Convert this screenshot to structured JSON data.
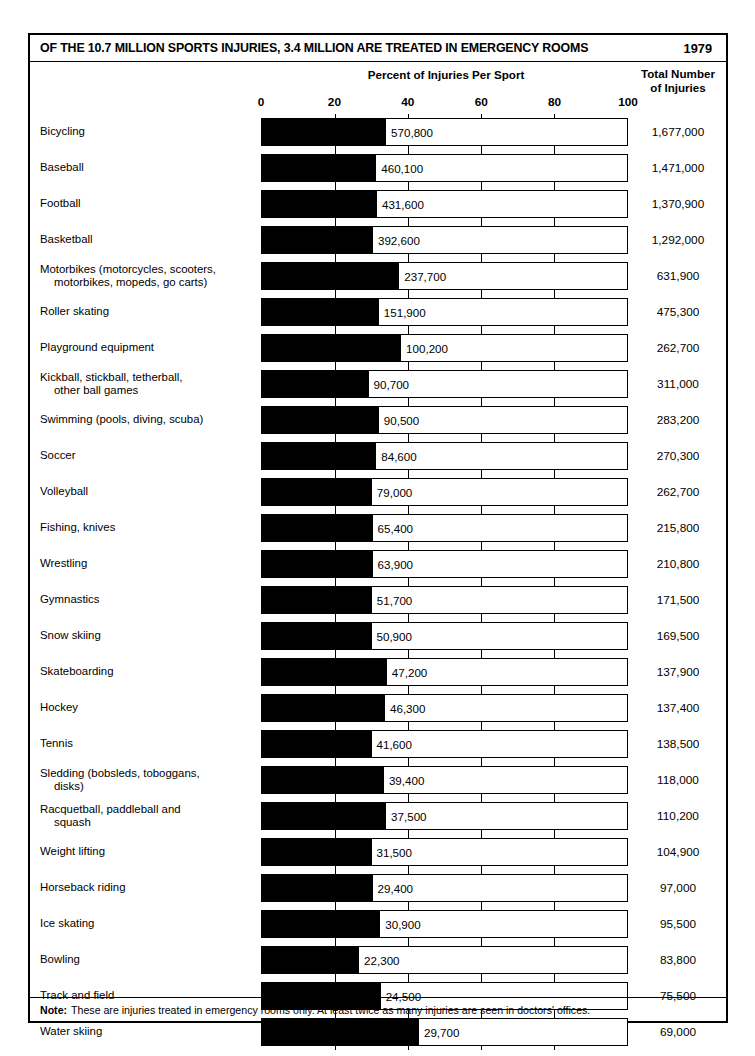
{
  "header": {
    "title": "OF THE 10.7 MILLION SPORTS INJURIES,  3.4 MILLION ARE TREATED IN EMERGENCY ROOMS",
    "year": "1979",
    "axis_title": "Percent of Injuries Per Sport",
    "total_header_line1": "Total Number",
    "total_header_line2": "of Injuries"
  },
  "note": {
    "label": "Note:",
    "text": "These are injuries treated in emergency rooms only.  At least twice as many injuries are seen in doctors' offices."
  },
  "chart_data": {
    "type": "bar",
    "title": "OF THE 10.7 MILLION SPORTS INJURIES,  3.4 MILLION ARE TREATED IN EMERGENCY ROOMS",
    "subtitle": "1979",
    "xlabel": "Percent of Injuries Per Sport",
    "ylabel": "",
    "orientation": "horizontal",
    "xlim": [
      0,
      100
    ],
    "xticks": [
      0,
      20,
      40,
      60,
      80,
      100
    ],
    "tick_labels": [
      "0",
      "20",
      "40",
      "60",
      "80",
      "100"
    ],
    "grid": true,
    "legend": "none",
    "value_column_header": "Total Number of Injuries",
    "bar_label_meaning": "Injuries treated in emergency rooms",
    "categories": [
      "Bicycling",
      "Baseball",
      "Football",
      "Basketball",
      "Motorbikes (motorcycles, scooters, motorbikes, mopeds, go carts)",
      "Roller skating",
      "Playground equipment",
      "Kickball, stickball, tetherball, other ball games",
      "Swimming (pools, diving, scuba)",
      "Soccer",
      "Volleyball",
      "Fishing, knives",
      "Wrestling",
      "Gymnastics",
      "Snow skiing",
      "Skateboarding",
      "Hockey",
      "Tennis",
      "Sledding (bobsleds, toboggans, disks)",
      "Racquetball, paddleball and squash",
      "Weight lifting",
      "Horseback riding",
      "Ice skating",
      "Bowling",
      "Track and field",
      "Water skiing"
    ],
    "series": [
      {
        "name": "Emergency room injuries",
        "values": [
          570800,
          460100,
          431600,
          392600,
          237700,
          151900,
          100200,
          90700,
          90500,
          84600,
          79000,
          65400,
          63900,
          51700,
          50900,
          47200,
          46300,
          41600,
          39400,
          37500,
          31500,
          29400,
          30900,
          22300,
          24500,
          29700
        ]
      },
      {
        "name": "Total injuries",
        "values": [
          1677000,
          1471000,
          1370900,
          1292000,
          631900,
          475300,
          262700,
          311000,
          283200,
          270300,
          262700,
          215800,
          210800,
          171500,
          169500,
          137900,
          137400,
          138500,
          118000,
          110200,
          104900,
          97000,
          95500,
          83800,
          75500,
          69000
        ]
      }
    ],
    "percent_values": [
      34.0,
      31.3,
      31.5,
      30.4,
      37.6,
      32.0,
      38.1,
      29.2,
      32.0,
      31.3,
      30.1,
      30.3,
      30.3,
      30.1,
      30.0,
      34.2,
      33.7,
      30.0,
      33.4,
      34.0,
      30.0,
      30.3,
      32.4,
      26.6,
      32.5,
      43.0
    ]
  },
  "rows": [
    {
      "label_1": "Bicycling",
      "label_2": "",
      "value": "570,800",
      "total": "1,677,000",
      "pct": 34.0
    },
    {
      "label_1": "Baseball",
      "label_2": "",
      "value": "460,100",
      "total": "1,471,000",
      "pct": 31.3
    },
    {
      "label_1": "Football",
      "label_2": "",
      "value": "431,600",
      "total": "1,370,900",
      "pct": 31.5
    },
    {
      "label_1": "Basketball",
      "label_2": "",
      "value": "392,600",
      "total": "1,292,000",
      "pct": 30.4
    },
    {
      "label_1": "Motorbikes (motorcycles, scooters,",
      "label_2": "motorbikes, mopeds, go carts)",
      "value": "237,700",
      "total": "631,900",
      "pct": 37.6
    },
    {
      "label_1": "Roller skating",
      "label_2": "",
      "value": "151,900",
      "total": "475,300",
      "pct": 32.0
    },
    {
      "label_1": "Playground equipment",
      "label_2": "",
      "value": "100,200",
      "total": "262,700",
      "pct": 38.1
    },
    {
      "label_1": "Kickball, stickball, tetherball,",
      "label_2": "other ball games",
      "value": "90,700",
      "total": "311,000",
      "pct": 29.2
    },
    {
      "label_1": "Swimming (pools, diving, scuba)",
      "label_2": "",
      "value": "90,500",
      "total": "283,200",
      "pct": 32.0
    },
    {
      "label_1": "Soccer",
      "label_2": "",
      "value": "84,600",
      "total": "270,300",
      "pct": 31.3
    },
    {
      "label_1": "Volleyball",
      "label_2": "",
      "value": "79,000",
      "total": "262,700",
      "pct": 30.1
    },
    {
      "label_1": "Fishing, knives",
      "label_2": "",
      "value": "65,400",
      "total": "215,800",
      "pct": 30.3
    },
    {
      "label_1": "Wrestling",
      "label_2": "",
      "value": "63,900",
      "total": "210,800",
      "pct": 30.3
    },
    {
      "label_1": "Gymnastics",
      "label_2": "",
      "value": "51,700",
      "total": "171,500",
      "pct": 30.1
    },
    {
      "label_1": "Snow skiing",
      "label_2": "",
      "value": "50,900",
      "total": "169,500",
      "pct": 30.0
    },
    {
      "label_1": "Skateboarding",
      "label_2": "",
      "value": "47,200",
      "total": "137,900",
      "pct": 34.2
    },
    {
      "label_1": "Hockey",
      "label_2": "",
      "value": "46,300",
      "total": "137,400",
      "pct": 33.7
    },
    {
      "label_1": "Tennis",
      "label_2": "",
      "value": "41,600",
      "total": "138,500",
      "pct": 30.0
    },
    {
      "label_1": "Sledding (bobsleds, toboggans,",
      "label_2": "disks)",
      "value": "39,400",
      "total": "118,000",
      "pct": 33.4
    },
    {
      "label_1": "Racquetball, paddleball and",
      "label_2": "squash",
      "value": "37,500",
      "total": "110,200",
      "pct": 34.0
    },
    {
      "label_1": "Weight lifting",
      "label_2": "",
      "value": "31,500",
      "total": "104,900",
      "pct": 30.0
    },
    {
      "label_1": "Horseback riding",
      "label_2": "",
      "value": "29,400",
      "total": "97,000",
      "pct": 30.3
    },
    {
      "label_1": "Ice skating",
      "label_2": "",
      "value": "30,900",
      "total": "95,500",
      "pct": 32.4
    },
    {
      "label_1": "Bowling",
      "label_2": "",
      "value": "22,300",
      "total": "83,800",
      "pct": 26.6
    },
    {
      "label_1": "Track and field",
      "label_2": "",
      "value": "24,500",
      "total": "75,500",
      "pct": 32.5
    },
    {
      "label_1": "Water skiing",
      "label_2": "",
      "value": "29,700",
      "total": "69,000",
      "pct": 43.0
    }
  ]
}
